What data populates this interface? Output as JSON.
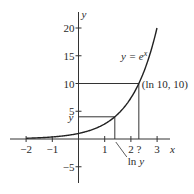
{
  "chart_data": {
    "type": "line",
    "title": "",
    "xlabel": "x",
    "ylabel": "y",
    "xlim": [
      -2.5,
      3.5
    ],
    "ylim": [
      -7,
      22
    ],
    "grid": false,
    "x_ticks": [
      -2,
      -1,
      1,
      2,
      3
    ],
    "x_tick_labels": [
      "−2",
      "−1",
      "1",
      "2",
      "3"
    ],
    "y_ticks": [
      20,
      15,
      10,
      5,
      -5
    ],
    "y_tick_labels": [
      "20",
      "15",
      "10",
      "5",
      "−5"
    ],
    "series": [
      {
        "name": "y = e^x",
        "function": "exp(x)",
        "x_range": [
          -2,
          3
        ]
      }
    ],
    "annotations": {
      "curve_label": "y = e",
      "curve_label_sup": "x",
      "point_label": "(ln 10, 10)",
      "point": [
        2.3026,
        10
      ],
      "y_marker_label": "y",
      "y_marker_value": 4,
      "ln_y_label": "ln y",
      "question_label": "?"
    }
  }
}
